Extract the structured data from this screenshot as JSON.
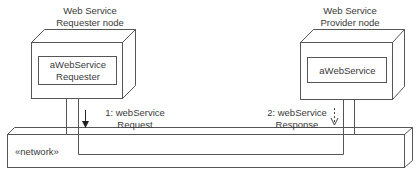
{
  "diagram": {
    "type": "UML deployment diagram",
    "nodes": [
      {
        "title_line1": "Web Service",
        "title_line2": "Requester node",
        "component_line1": "aWebService",
        "component_line2": "Requester"
      },
      {
        "title_line1": "Web Service",
        "title_line2": "Provider node",
        "component_line1": "aWebService",
        "component_line2": ""
      }
    ],
    "network": {
      "label": "«network»"
    },
    "messages": [
      {
        "line1": "1: webService",
        "line2": "Request",
        "arrow": "solid-down"
      },
      {
        "line1": "2: webService",
        "line2": "Response",
        "arrow": "dashed-open-down"
      }
    ],
    "colors": {
      "stroke": "#555555",
      "text": "#3a3a3a",
      "background": "#ffffff"
    }
  }
}
